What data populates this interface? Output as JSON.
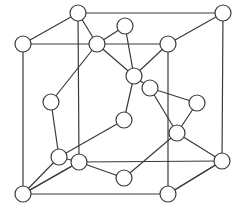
{
  "diagram": {
    "title": "",
    "type": "crystal-lattice",
    "colors": {
      "stroke": "#3a3a3a",
      "atom_fill": "#ffffff",
      "background": "#ffffff"
    },
    "atom_radius": 8,
    "atoms": [
      {
        "id": "back-tl",
        "x": 78,
        "y": 13
      },
      {
        "id": "back-tr",
        "x": 223,
        "y": 13
      },
      {
        "id": "back-br",
        "x": 222,
        "y": 161
      },
      {
        "id": "back-bl",
        "x": 79,
        "y": 162
      },
      {
        "id": "front-tl",
        "x": 23,
        "y": 44
      },
      {
        "id": "front-tr",
        "x": 168,
        "y": 44
      },
      {
        "id": "front-br",
        "x": 168,
        "y": 194
      },
      {
        "id": "front-bl",
        "x": 23,
        "y": 194
      },
      {
        "id": "top-face",
        "x": 97,
        "y": 44
      },
      {
        "id": "back-face",
        "x": 125,
        "y": 26
      },
      {
        "id": "center-a",
        "x": 134,
        "y": 76
      },
      {
        "id": "inner-b",
        "x": 150,
        "y": 88
      },
      {
        "id": "left-face",
        "x": 51,
        "y": 102
      },
      {
        "id": "inner-c",
        "x": 124,
        "y": 120
      },
      {
        "id": "right-face",
        "x": 197,
        "y": 103
      },
      {
        "id": "inner-d",
        "x": 177,
        "y": 133
      },
      {
        "id": "inner-e",
        "x": 59,
        "y": 157
      },
      {
        "id": "bottom-face",
        "x": 124,
        "y": 178
      }
    ],
    "edges": [
      [
        "back-tl",
        "back-tr"
      ],
      [
        "back-tr",
        "back-br"
      ],
      [
        "back-tl",
        "back-bl"
      ],
      [
        "back-bl",
        "back-br"
      ],
      [
        "front-tl",
        "front-tr"
      ],
      [
        "front-tr",
        "front-br"
      ],
      [
        "front-tl",
        "front-bl"
      ],
      [
        "front-bl",
        "front-br"
      ],
      [
        "back-tl",
        "front-tl"
      ],
      [
        "back-tr",
        "front-tr"
      ],
      [
        "back-br",
        "front-br"
      ],
      [
        "back-bl",
        "front-bl"
      ],
      [
        "back-tl",
        "top-face"
      ],
      [
        "top-face",
        "back-face"
      ],
      [
        "top-face",
        "center-a"
      ],
      [
        "top-face",
        "left-face"
      ],
      [
        "back-face",
        "center-a"
      ],
      [
        "front-tr",
        "center-a"
      ],
      [
        "center-a",
        "inner-c"
      ],
      [
        "center-a",
        "inner-b"
      ],
      [
        "inner-b",
        "right-face"
      ],
      [
        "inner-b",
        "inner-d"
      ],
      [
        "right-face",
        "inner-d"
      ],
      [
        "inner-d",
        "back-br"
      ],
      [
        "inner-d",
        "bottom-face"
      ],
      [
        "inner-c",
        "inner-e"
      ],
      [
        "left-face",
        "inner-e"
      ],
      [
        "inner-e",
        "front-bl"
      ],
      [
        "back-bl",
        "front-bl"
      ],
      [
        "back-bl",
        "inner-e"
      ],
      [
        "back-bl",
        "bottom-face"
      ],
      [
        "front-br",
        "back-br"
      ]
    ]
  }
}
